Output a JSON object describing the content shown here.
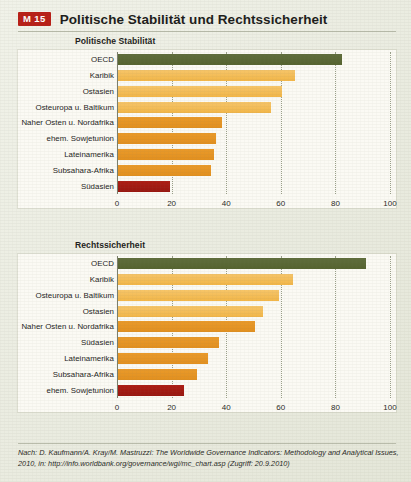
{
  "header": {
    "badge": "M 15",
    "title": "Politische Stabilität und Rechtssicherheit"
  },
  "source": {
    "line1": "Nach: D. Kaufmann/A. Kray/M. Mastruzzi: The Worldwide Governance Indicators: Methodology and",
    "line2": "Analytical Issues, 2010, in: http://info.worldbank.org/governance/wgi/mc_chart.asp (Zugriff: 20.9.2010)"
  },
  "colors": {
    "green": "#5a6836",
    "amber": "#f4bd55",
    "orange": "#e6941f",
    "red": "#a51b12",
    "page_bg": "#e9ebdd",
    "plot_bg": "#fbfaf4",
    "badge_bg": "#b81f17",
    "axis": "#7b7f6c"
  },
  "chart_data": [
    {
      "type": "bar",
      "orientation": "horizontal",
      "title": "Politische Stabilität",
      "xlabel": "",
      "ylabel": "",
      "xlim": [
        0,
        100
      ],
      "xticks": [
        0,
        20,
        40,
        60,
        80,
        100
      ],
      "ticklabels": [
        "0",
        "20",
        "40",
        "60",
        "80",
        "100"
      ],
      "grid": true,
      "legend": "none",
      "categories": [
        "OECD",
        "Karibik",
        "Ostasien",
        "Osteuropa u. Baltikum",
        "Naher Osten u. Nordafrika",
        "ehem. Sowjetunion",
        "Lateinamerika",
        "Subsahara-Afrika",
        "Südasien"
      ],
      "values": [
        82,
        65,
        60,
        56,
        38,
        36,
        35,
        34,
        19
      ],
      "bar_colors": [
        "green",
        "amber",
        "amber",
        "amber",
        "orange",
        "orange",
        "orange",
        "orange",
        "red"
      ]
    },
    {
      "type": "bar",
      "orientation": "horizontal",
      "title": "Rechtssicherheit",
      "xlabel": "",
      "ylabel": "",
      "xlim": [
        0,
        100
      ],
      "xticks": [
        0,
        20,
        40,
        60,
        80,
        100
      ],
      "ticklabels": [
        "0",
        "20",
        "40",
        "60",
        "80",
        "100"
      ],
      "grid": true,
      "legend": "none",
      "categories": [
        "OECD",
        "Karibik",
        "Osteuropa u. Baltikum",
        "Ostasien",
        "Naher Osten u. Nordafrika",
        "Südasien",
        "Lateinamerika",
        "Subsahara-Afrika",
        "ehem. Sowjetunion"
      ],
      "values": [
        91,
        64,
        59,
        53,
        50,
        37,
        33,
        29,
        24
      ],
      "bar_colors": [
        "green",
        "amber",
        "amber",
        "amber",
        "orange",
        "orange",
        "orange",
        "orange",
        "red"
      ]
    }
  ]
}
